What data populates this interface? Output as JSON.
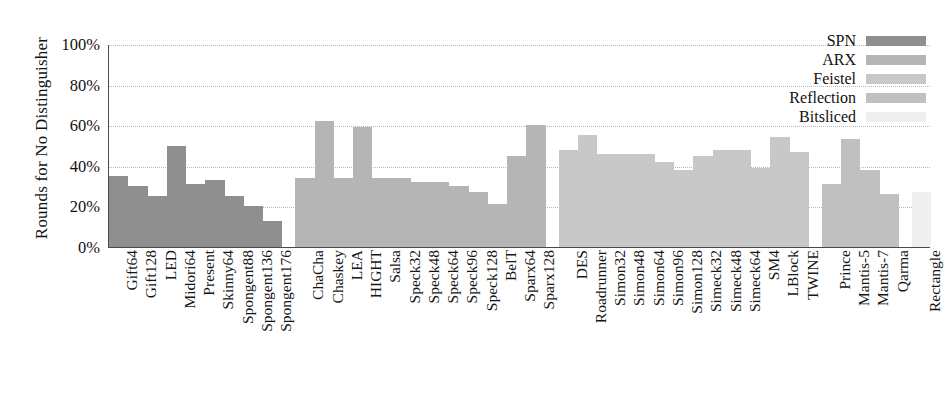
{
  "chart_data": {
    "type": "bar",
    "title": "",
    "xlabel": "",
    "ylabel": "Rounds for No Distinguisher",
    "ylim": [
      0,
      100
    ],
    "ytick_labels": [
      "0%",
      "20%",
      "40%",
      "60%",
      "80%",
      "100%"
    ],
    "ytick_values": [
      0,
      20,
      40,
      60,
      80,
      100
    ],
    "grid": true,
    "legend_position": "top-right",
    "legend": [
      {
        "name": "SPN",
        "color": "#8f8f8f"
      },
      {
        "name": "ARX",
        "color": "#b5b5b5"
      },
      {
        "name": "Feistel",
        "color": "#c8c8c8"
      },
      {
        "name": "Reflection",
        "color": "#c0c0c0"
      },
      {
        "name": "Bitsliced",
        "color": "#efefef"
      }
    ],
    "groups": [
      {
        "name": "SPN",
        "color": "#8f8f8f",
        "categories": [
          "Gift64",
          "Gift128",
          "LED",
          "Midori64",
          "Present",
          "Skinny64",
          "Spongent88",
          "Spongent136",
          "Spongent176"
        ],
        "values": [
          35,
          30,
          25,
          50,
          31,
          33,
          25,
          20,
          13
        ]
      },
      {
        "name": "ARX",
        "color": "#b5b5b5",
        "categories": [
          "ChaCha",
          "Chaskey",
          "LEA",
          "HIGHT",
          "Salsa",
          "Speck32",
          "Speck48",
          "Speck64",
          "Speck96",
          "Speck128",
          "BelT",
          "Sparx64",
          "Sparx128"
        ],
        "values": [
          34,
          62,
          34,
          59,
          34,
          34,
          32,
          32,
          30,
          27,
          21,
          45,
          60
        ]
      },
      {
        "name": "Feistel",
        "color": "#c8c8c8",
        "categories": [
          "DES",
          "Roadrunner",
          "Simon32",
          "Simon48",
          "Simon64",
          "Simon96",
          "Simon128",
          "Simeck32",
          "Simeck48",
          "Simeck64",
          "SM4",
          "LBlock",
          "TWINE"
        ],
        "values": [
          48,
          55,
          46,
          46,
          46,
          42,
          38,
          45,
          48,
          48,
          39,
          54,
          47
        ]
      },
      {
        "name": "Reflection",
        "color": "#c0c0c0",
        "categories": [
          "Prince",
          "Mantis-5",
          "Mantis-7",
          "Qarma"
        ],
        "values": [
          31,
          53,
          38,
          26
        ]
      },
      {
        "name": "Bitsliced",
        "color": "#efefef",
        "categories": [
          "Rectangle"
        ],
        "values": [
          27
        ]
      }
    ]
  }
}
